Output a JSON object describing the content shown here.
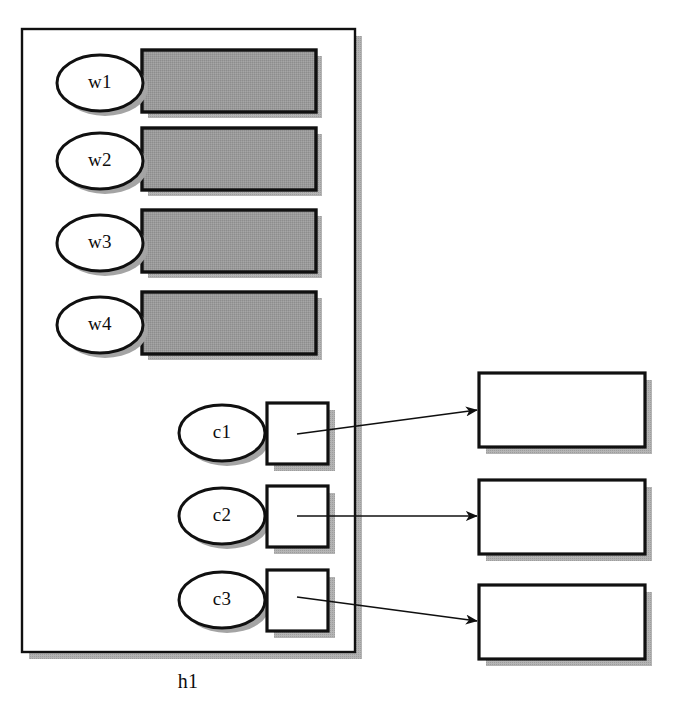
{
  "diagram": {
    "title": "h1",
    "background_color": "#ffffff",
    "stroke_color": "#101010",
    "shadow_color": "#9d9d9d",
    "gray_fill": "#9a9a9a",
    "white_fill": "#ffffff",
    "container": {
      "label": "h1",
      "label_x": 188,
      "label_y": 688,
      "x": 22,
      "y": 29,
      "width": 333,
      "height": 623,
      "shadow_offset": 7
    },
    "worker_nodes": [
      {
        "label": "w1",
        "ellipse_cx": 100,
        "ellipse_cy": 83,
        "ellipse_rx": 43,
        "ellipse_ry": 28,
        "rect_x": 142,
        "rect_y": 50,
        "rect_width": 174,
        "rect_height": 62
      },
      {
        "label": "w2",
        "ellipse_cx": 100,
        "ellipse_cy": 161,
        "ellipse_rx": 43,
        "ellipse_ry": 28,
        "rect_x": 142,
        "rect_y": 128,
        "rect_width": 174,
        "rect_height": 62
      },
      {
        "label": "w3",
        "ellipse_cx": 100,
        "ellipse_cy": 243,
        "ellipse_rx": 43,
        "ellipse_ry": 28,
        "rect_x": 142,
        "rect_y": 210,
        "rect_width": 174,
        "rect_height": 62
      },
      {
        "label": "w4",
        "ellipse_cx": 100,
        "ellipse_cy": 325,
        "ellipse_rx": 43,
        "ellipse_ry": 28,
        "rect_x": 142,
        "rect_y": 292,
        "rect_width": 174,
        "rect_height": 62
      }
    ],
    "channel_nodes": [
      {
        "label": "c1",
        "ellipse_cx": 222,
        "ellipse_cy": 433,
        "ellipse_rx": 43,
        "ellipse_ry": 28,
        "square_x": 267,
        "square_y": 403,
        "square_size": 61
      },
      {
        "label": "c2",
        "ellipse_cx": 222,
        "ellipse_cy": 516,
        "ellipse_rx": 43,
        "ellipse_ry": 28,
        "square_x": 267,
        "square_y": 486,
        "square_size": 61
      },
      {
        "label": "c3",
        "ellipse_cx": 222,
        "ellipse_cy": 600,
        "ellipse_rx": 43,
        "ellipse_ry": 28,
        "square_x": 267,
        "square_y": 570,
        "square_size": 61
      }
    ],
    "target_boxes": [
      {
        "label": "",
        "x": 479,
        "y": 373,
        "width": 166,
        "height": 74
      },
      {
        "label": "",
        "x": 479,
        "y": 480,
        "width": 166,
        "height": 74
      },
      {
        "label": "",
        "x": 479,
        "y": 585,
        "width": 166,
        "height": 74
      }
    ],
    "connections": [
      {
        "from": "c1",
        "to": "box1",
        "x1": 297,
        "y1": 434,
        "x2": 477,
        "y2": 410
      },
      {
        "from": "c2",
        "to": "box2",
        "x1": 297,
        "y1": 516,
        "x2": 477,
        "y2": 516
      },
      {
        "from": "c3",
        "to": "box3",
        "x1": 297,
        "y1": 597,
        "x2": 477,
        "y2": 621
      }
    ]
  }
}
